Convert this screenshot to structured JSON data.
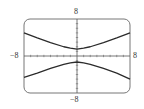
{
  "figure": {
    "label": ""
  },
  "chart_data": {
    "type": "line",
    "title": "",
    "xlabel": "",
    "ylabel": "",
    "xlim": [
      -8,
      8
    ],
    "ylim": [
      -8,
      8
    ],
    "grid": false,
    "tick_labels": {
      "x_min": "−8",
      "x_max": "8",
      "y_min": "−8",
      "y_max": "8"
    },
    "x_ticks": [
      -7,
      -6,
      -5,
      -4,
      -3,
      -2,
      -1,
      1,
      2,
      3,
      4,
      5,
      6,
      7
    ],
    "y_ticks": [
      -7,
      -6,
      -5,
      -4,
      -3,
      -2,
      -1,
      1,
      2,
      3,
      4,
      5,
      6,
      7
    ],
    "series": [
      {
        "name": "upper branch",
        "x": [
          -8,
          -6,
          -4,
          -2,
          -1,
          0,
          1,
          2,
          4,
          6,
          8
        ],
        "y": [
          5.0,
          3.9,
          2.9,
          2.0,
          1.7,
          1.5,
          1.7,
          2.0,
          2.9,
          3.9,
          5.0
        ]
      },
      {
        "name": "lower branch",
        "x": [
          -8,
          -6,
          -4,
          -2,
          -1,
          0,
          1,
          2,
          4,
          6,
          8
        ],
        "y": [
          -4.6,
          -3.7,
          -2.7,
          -1.8,
          -1.5,
          -1.3,
          -1.5,
          -1.8,
          -2.7,
          -3.7,
          -5.0
        ]
      }
    ],
    "colors": {
      "curve": "#2b2b2b",
      "axis": "#555555",
      "frame": "#777777"
    }
  }
}
